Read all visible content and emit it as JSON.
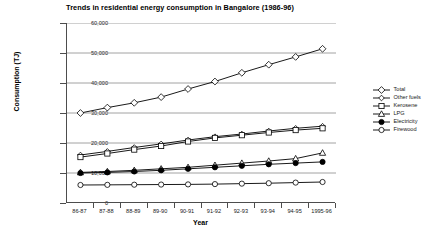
{
  "chart_data": {
    "type": "line",
    "title": "Trends in residential energy consumption in Bangalore (1986-96)",
    "xlabel": "Year",
    "ylabel": "Consumption (TJ)",
    "grid": "horizontal",
    "legend_position": "right",
    "ylim": [
      0,
      60000
    ],
    "ytick_labels": [
      "60,000",
      "50,000",
      "40,000",
      "30,000",
      "20,000",
      "10,000",
      "0"
    ],
    "ytick_values": [
      60000,
      50000,
      40000,
      30000,
      20000,
      10000,
      0
    ],
    "categories": [
      "86-87",
      "87-88",
      "88-89",
      "89-90",
      "90-91",
      "91-92",
      "92-93",
      "93-94",
      "94-95",
      "1995-96"
    ],
    "series": [
      {
        "name": "Total",
        "marker": "diamond-open",
        "values": [
          30000,
          31800,
          33400,
          35300,
          38000,
          40500,
          43400,
          46100,
          48700,
          51400
        ]
      },
      {
        "name": "Other fuels",
        "marker": "diamond-open-small",
        "values": [
          16000,
          17200,
          18500,
          19700,
          21000,
          22100,
          23000,
          24000,
          24900,
          25600
        ]
      },
      {
        "name": "Kerosene",
        "marker": "square-open",
        "values": [
          15300,
          16500,
          17800,
          19000,
          20500,
          21700,
          22600,
          23500,
          24300,
          24900
        ]
      },
      {
        "name": "LPG",
        "marker": "triangle-open",
        "values": [
          10200,
          10500,
          10900,
          11400,
          11900,
          12600,
          13300,
          14000,
          14800,
          16700
        ]
      },
      {
        "name": "Electricity",
        "marker": "circle-filled",
        "values": [
          10000,
          10200,
          10500,
          10900,
          11400,
          11900,
          12400,
          12900,
          13300,
          13700
        ]
      },
      {
        "name": "Firewood",
        "marker": "circle-open",
        "values": [
          6000,
          6050,
          6100,
          6150,
          6200,
          6300,
          6450,
          6600,
          6800,
          7000
        ]
      }
    ]
  }
}
